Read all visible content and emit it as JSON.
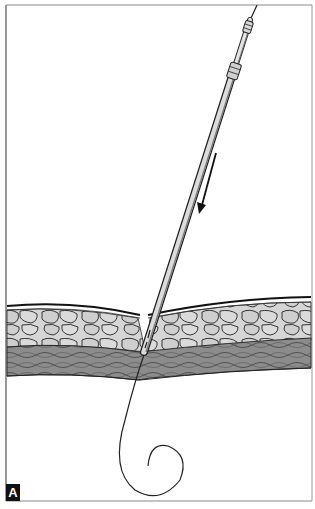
{
  "figure": {
    "panel_label": "A",
    "colors": {
      "frame": "#777777",
      "fat_fill": "#d4d4d4",
      "muscle_fill": "#8a8a8a",
      "outline": "#1a1a1a",
      "needle_light": "#e6e6e6",
      "needle_dark": "#5a5a5a"
    },
    "elements": {
      "arrow": "direction-arrow",
      "needle": "needle",
      "guidewire": "guidewire",
      "tissue_layers": [
        "skin",
        "subcutaneous-fat",
        "muscle"
      ]
    }
  }
}
